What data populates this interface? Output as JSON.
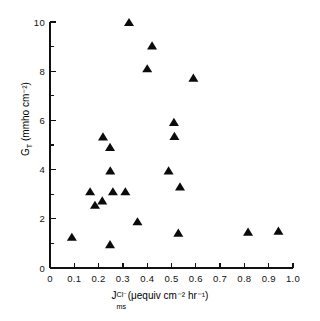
{
  "chart_data": {
    "type": "scatter",
    "title": "",
    "xlabel_parts": {
      "symbol": "J",
      "subscript": "ms",
      "superscript": "Cl⁻",
      "units": "(μequiv cm⁻² hr⁻¹)"
    },
    "ylabel_parts": {
      "symbol": "G",
      "subscript": "T",
      "units": "(mmho cm⁻²)"
    },
    "xlabel": "J_ms^Cl- (μequiv cm-2 hr-1)",
    "ylabel": "G_T (mmho cm-2)",
    "xlim": [
      0,
      1.0
    ],
    "ylim": [
      0,
      10
    ],
    "xticks": [
      0,
      0.1,
      0.2,
      0.3,
      0.4,
      0.5,
      0.6,
      0.7,
      0.8,
      0.9,
      1.0
    ],
    "xticklabels": [
      "0",
      "0.1",
      "0.2",
      "0.3",
      "0.4",
      "0.5",
      "0.6",
      "0.7",
      "0.8",
      "0.9",
      "1.0"
    ],
    "yticks": [
      0,
      2,
      4,
      6,
      8,
      10
    ],
    "yticklabels": [
      "0",
      "2",
      "4",
      "6",
      "8",
      "10"
    ],
    "yminorticks": [
      1,
      3,
      5,
      7,
      9
    ],
    "grid": false,
    "legend": null,
    "marker": "triangle-up",
    "marker_color": "#0b0b0b",
    "points": [
      {
        "x": 0.09,
        "y": 1.25
      },
      {
        "x": 0.165,
        "y": 3.1
      },
      {
        "x": 0.185,
        "y": 2.55
      },
      {
        "x": 0.215,
        "y": 2.73
      },
      {
        "x": 0.218,
        "y": 5.33
      },
      {
        "x": 0.247,
        "y": 0.95
      },
      {
        "x": 0.247,
        "y": 4.9
      },
      {
        "x": 0.248,
        "y": 3.95
      },
      {
        "x": 0.259,
        "y": 3.1
      },
      {
        "x": 0.31,
        "y": 3.1
      },
      {
        "x": 0.325,
        "y": 9.98
      },
      {
        "x": 0.36,
        "y": 1.88
      },
      {
        "x": 0.4,
        "y": 8.1
      },
      {
        "x": 0.42,
        "y": 9.03
      },
      {
        "x": 0.488,
        "y": 3.95
      },
      {
        "x": 0.51,
        "y": 5.92
      },
      {
        "x": 0.512,
        "y": 5.35
      },
      {
        "x": 0.528,
        "y": 1.42
      },
      {
        "x": 0.535,
        "y": 3.3
      },
      {
        "x": 0.59,
        "y": 7.72
      },
      {
        "x": 0.815,
        "y": 1.46
      },
      {
        "x": 0.94,
        "y": 1.5
      }
    ]
  }
}
